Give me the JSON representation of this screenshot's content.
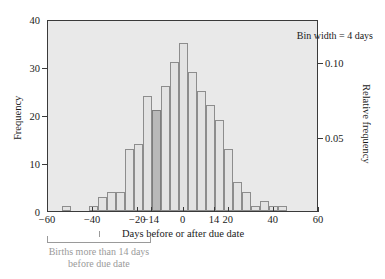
{
  "chart_data": {
    "type": "bar",
    "title": "",
    "subtitle": "",
    "xlabel": "Days before or after due date",
    "ylabel": "Frequency",
    "y2label": "Relative frequency",
    "bin_width": 4,
    "xlim": [
      -60,
      60
    ],
    "ylim": [
      0,
      40
    ],
    "y2lim": [
      0,
      0.129
    ],
    "grid": false,
    "legend": null,
    "xticks": [
      -60,
      -40,
      -20,
      -14,
      0,
      14,
      20,
      40,
      60
    ],
    "xticklabels": [
      "−60",
      "−40",
      "−20",
      "−14",
      "0",
      "14",
      "20",
      "40",
      "60"
    ],
    "yticks": [
      0,
      10,
      20,
      30,
      40
    ],
    "yticklabels": [
      "0",
      "10",
      "20",
      "30",
      "40"
    ],
    "y2ticks": [
      0.05,
      0.1
    ],
    "y2ticklabels": [
      "0.05",
      "0.10"
    ],
    "bins": [
      {
        "left": -54,
        "right": -50,
        "value": 1,
        "highlight": false
      },
      {
        "left": -42,
        "right": -38,
        "value": 1,
        "highlight": false
      },
      {
        "left": -38,
        "right": -34,
        "value": 3,
        "highlight": false
      },
      {
        "left": -34,
        "right": -30,
        "value": 4,
        "highlight": false
      },
      {
        "left": -30,
        "right": -26,
        "value": 4,
        "highlight": false
      },
      {
        "left": -26,
        "right": -22,
        "value": 13,
        "highlight": false
      },
      {
        "left": -22,
        "right": -18,
        "value": 14,
        "highlight": false
      },
      {
        "left": -18,
        "right": -14,
        "value": 24,
        "highlight": false
      },
      {
        "left": -14,
        "right": -10,
        "value": 21,
        "highlight": true
      },
      {
        "left": -10,
        "right": -6,
        "value": 26,
        "highlight": false
      },
      {
        "left": -6,
        "right": -2,
        "value": 31,
        "highlight": false
      },
      {
        "left": -2,
        "right": 2,
        "value": 35,
        "highlight": false
      },
      {
        "left": 2,
        "right": 6,
        "value": 29,
        "highlight": false
      },
      {
        "left": 6,
        "right": 10,
        "value": 25,
        "highlight": false
      },
      {
        "left": 10,
        "right": 14,
        "value": 22,
        "highlight": false
      },
      {
        "left": 14,
        "right": 18,
        "value": 19,
        "highlight": false
      },
      {
        "left": 18,
        "right": 22,
        "value": 13,
        "highlight": false
      },
      {
        "left": 22,
        "right": 26,
        "value": 6,
        "highlight": false
      },
      {
        "left": 26,
        "right": 30,
        "value": 4,
        "highlight": false
      },
      {
        "left": 30,
        "right": 34,
        "value": 1,
        "highlight": false
      },
      {
        "left": 34,
        "right": 38,
        "value": 2,
        "highlight": false
      },
      {
        "left": 38,
        "right": 42,
        "value": 1,
        "highlight": false
      },
      {
        "left": 42,
        "right": 46,
        "value": 1,
        "highlight": false
      }
    ],
    "annotations": [
      {
        "name": "bin-width-note",
        "text": "Bin width = 4 days"
      },
      {
        "name": "bracket-note",
        "line1": "Births more than 14 days",
        "line2": "before due date",
        "span": [
          -60,
          -14
        ]
      }
    ]
  },
  "colors": {
    "plot_background": "#e9e9e9",
    "bar_fill": "#e3e3e3",
    "bar_edge": "#8d8d8d",
    "bar_highlight_fill": "#b9b9b9",
    "axis": "#3a3a3a",
    "annotation_gray": "#9a9a9a",
    "text": "#1a1a1a"
  }
}
